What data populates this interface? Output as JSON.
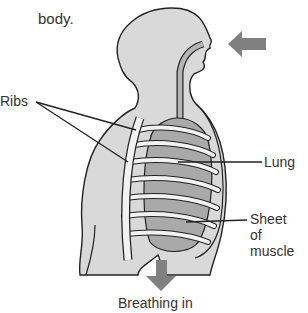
{
  "diagram": {
    "caption_lines": [
      "carbon dioxide from the",
      "body."
    ],
    "labels": {
      "ribs": "Ribs",
      "lung": "Lung",
      "sheet_of_muscle": [
        "Sheet",
        "of",
        "muscle"
      ],
      "title": "Breathing in"
    },
    "arrows": {
      "inhale": "arrow-left (air entering nose)",
      "diaphragm": "arrow-down (diaphragm moves down)"
    },
    "colors": {
      "body_fill": "#d9d9d9",
      "lung_fill": "#a9a9a9",
      "rib_fill": "#f2f2f2",
      "outline": "#222222",
      "arrow": "#808080",
      "text": "#333333"
    }
  }
}
